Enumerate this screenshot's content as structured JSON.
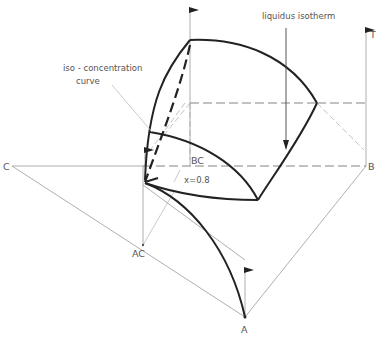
{
  "diagram": {
    "labels": {
      "vertex_a": "A",
      "vertex_b": "B",
      "vertex_c": "C",
      "edge_ac": "AC",
      "edge_bc": "BC",
      "temperature_axis": "T",
      "iso_concentration_line1": "iso - concentration",
      "iso_concentration_line2": "curve",
      "liquidus_isotherm": "liquidus isotherm",
      "concentration_value": "x=0.8"
    },
    "colors": {
      "curve": "#222222",
      "guide_line": "#9a9a9a",
      "text": "#555555",
      "background": "#ffffff"
    }
  }
}
